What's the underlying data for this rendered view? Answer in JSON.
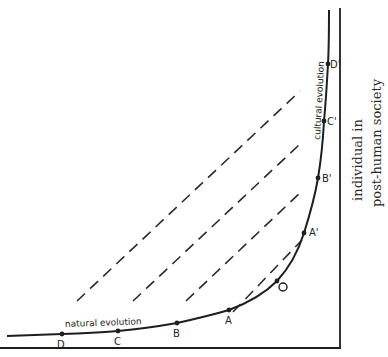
{
  "diagram": {
    "type": "evolution-curve",
    "curve_labels": {
      "lower": "natural evolution",
      "upper": "cultural evolution"
    },
    "side_label": {
      "line1": "individual in",
      "line2": "post-human society"
    },
    "points_lower": [
      {
        "id": "D",
        "label": "D",
        "x": 62,
        "y": 334
      },
      {
        "id": "C",
        "label": "C",
        "x": 118,
        "y": 331
      },
      {
        "id": "B",
        "label": "B",
        "x": 177,
        "y": 323
      },
      {
        "id": "A",
        "label": "A",
        "x": 229,
        "y": 310
      }
    ],
    "point_origin": {
      "id": "O",
      "label": "O",
      "x": 277,
      "y": 281
    },
    "points_upper": [
      {
        "id": "A'",
        "label": "A'",
        "x": 304,
        "y": 233
      },
      {
        "id": "B'",
        "label": "B'",
        "x": 318,
        "y": 178
      },
      {
        "id": "C'",
        "label": "C'",
        "x": 324,
        "y": 121
      },
      {
        "id": "D'",
        "label": "D'",
        "x": 328,
        "y": 64
      }
    ],
    "dashed_links": [
      {
        "from": "D",
        "to": "D'"
      },
      {
        "from": "C",
        "to": "C'"
      },
      {
        "from": "B",
        "to": "B'"
      },
      {
        "from": "A",
        "to": "A'"
      }
    ]
  }
}
